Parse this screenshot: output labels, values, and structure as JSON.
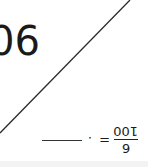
{
  "figure": {
    "angle_label": "90°",
    "line_color": "#222222",
    "orientation": "rotated 180°"
  },
  "equation": {
    "numerator": "6",
    "denominator": "100",
    "equals": "=",
    "decimal_point": ".",
    "answer_blank": ""
  }
}
